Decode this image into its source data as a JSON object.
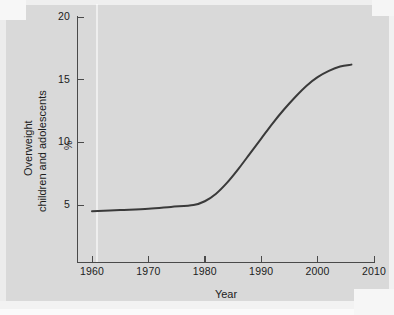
{
  "figure": {
    "background_color": "#d9d9d9",
    "ink_color": "#3a3a3a",
    "axis_color": "#4a4a4a"
  },
  "axes": {
    "y_title_line1": "Overweight",
    "y_title_line2": "children and adolescents",
    "y_unit_label": "%",
    "x_title": "Year"
  },
  "chart_data": {
    "type": "line",
    "title": "",
    "subtitle": "",
    "xlabel": "Year",
    "ylabel": "Overweight children and adolescents",
    "yunit": "%",
    "xlim": [
      1955,
      2010
    ],
    "ylim": [
      0,
      20
    ],
    "xticks": [
      1960,
      1970,
      1980,
      1990,
      2000,
      2010
    ],
    "xticklabels": [
      "1960",
      "1970",
      "1980",
      "1990",
      "2000",
      "2010"
    ],
    "yticks": [
      5,
      10,
      15,
      20
    ],
    "yticklabels": [
      "5",
      "10",
      "15",
      "20"
    ],
    "grid": false,
    "legend": null,
    "series": [
      {
        "name": "Overweight children and adolescents",
        "color": "#3a3a3a",
        "line_width": 2,
        "x": [
          1960,
          1965,
          1970,
          1974,
          1978,
          1980,
          1982,
          1984,
          1986,
          1988,
          1990,
          1992,
          1994,
          1996,
          1998,
          2000,
          2002,
          2004,
          2006
        ],
        "values": [
          4.5,
          4.6,
          4.7,
          4.85,
          5.0,
          5.3,
          5.9,
          6.8,
          7.9,
          9.1,
          10.3,
          11.5,
          12.6,
          13.6,
          14.5,
          15.2,
          15.7,
          16.05,
          16.2
        ]
      }
    ],
    "annotations": []
  }
}
